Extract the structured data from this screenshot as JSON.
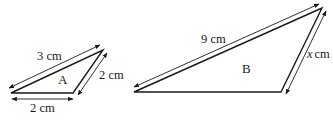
{
  "diagram": {
    "triangles": [
      {
        "name": "A",
        "sides": [
          {
            "id": "long",
            "label": "3 cm",
            "value": 3,
            "unit": "cm"
          },
          {
            "id": "right",
            "label": "2 cm",
            "value": 2,
            "unit": "cm"
          },
          {
            "id": "base",
            "label": "2 cm",
            "value": 2,
            "unit": "cm"
          }
        ]
      },
      {
        "name": "B",
        "sides": [
          {
            "id": "long",
            "label": "9 cm",
            "value": 9,
            "unit": "cm"
          },
          {
            "id": "right",
            "label_var": "x",
            "label_unit": "cm",
            "value": null,
            "unit": "cm"
          }
        ]
      }
    ],
    "colors": {
      "stroke": "#1a1a1a",
      "background": "#ffffff"
    }
  }
}
